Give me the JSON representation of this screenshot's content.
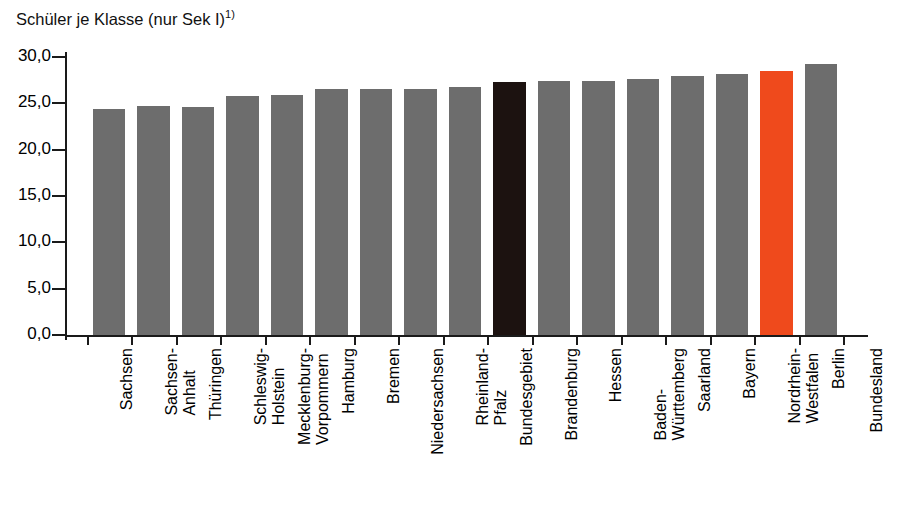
{
  "chart_data": {
    "type": "bar",
    "title": "Schüler je Klasse (nur Sek I)",
    "title_footnote": "1)",
    "xlabel": "Bundesland",
    "ylabel": "",
    "ylim": [
      0,
      30
    ],
    "ytick_labels": [
      "30,0",
      "25,0",
      "20,0",
      "15,0",
      "10,0",
      "5,0",
      "0,0"
    ],
    "ytick_values": [
      30,
      25,
      20,
      15,
      10,
      5,
      0
    ],
    "grid": false,
    "legend": "none",
    "categories": [
      "Sachsen",
      "Sachsen-Anhalt",
      "Thüringen",
      "Schleswig-Holstein",
      "Mecklenburg-Vorpommern",
      "Hamburg",
      "Bremen",
      "Niedersachsen",
      "Rheinland-Pfalz",
      "Bundesgebiet",
      "Brandenburg",
      "Hessen",
      "Baden-Württemberg",
      "Saarland",
      "Bayern",
      "Nordrhein-Westfalen",
      "Berlin"
    ],
    "category_lines": [
      [
        "Sachsen"
      ],
      [
        "Sachsen-",
        "Anhalt"
      ],
      [
        "Thüringen"
      ],
      [
        "Schleswig-",
        "Holstein"
      ],
      [
        "Mecklenburg-",
        "Vorpommern"
      ],
      [
        "Hamburg"
      ],
      [
        "Bremen"
      ],
      [
        "Niedersachsen"
      ],
      [
        "Rheinland-",
        "Pfalz"
      ],
      [
        "Bundesgebiet"
      ],
      [
        "Brandenburg"
      ],
      [
        "Hessen"
      ],
      [
        "Baden-",
        "Württemberg"
      ],
      [
        "Saarland"
      ],
      [
        "Bayern"
      ],
      [
        "Nordrhein-",
        "Westfalen"
      ],
      [
        "Berlin"
      ]
    ],
    "values": [
      24.4,
      24.7,
      24.6,
      25.8,
      25.9,
      26.6,
      26.6,
      26.5,
      26.8,
      27.3,
      27.4,
      27.4,
      27.6,
      28.0,
      28.2,
      28.5,
      29.3
    ],
    "bar_styles": [
      "grey",
      "grey",
      "grey",
      "grey",
      "grey",
      "grey",
      "grey",
      "grey",
      "grey",
      "dark",
      "grey",
      "grey",
      "grey",
      "grey",
      "grey",
      "accent",
      "grey"
    ]
  },
  "colors": {
    "bar_grey": "#6d6d6d",
    "bar_dark": "#1c1210",
    "bar_accent": "#ef4a1c",
    "axis": "#1a1a1a",
    "background": "#ffffff"
  }
}
